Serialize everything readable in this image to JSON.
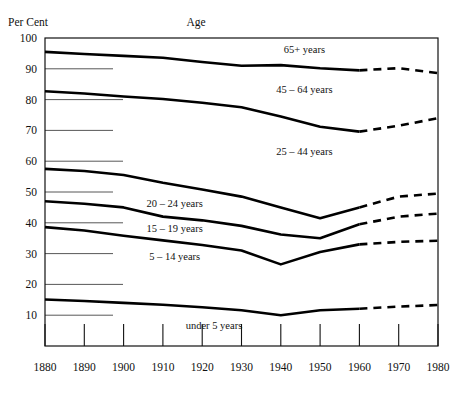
{
  "chart_data": {
    "type": "line",
    "title": "",
    "ylabel": "Per Cent",
    "xlabel": "",
    "legend_title": "Age",
    "grid": "horizontal-left-stubs",
    "legend_position": "inline-labels",
    "xlim": [
      1880,
      1980
    ],
    "ylim": [
      0,
      100
    ],
    "x": [
      1880,
      1890,
      1900,
      1910,
      1920,
      1930,
      1940,
      1950,
      1960,
      1970,
      1980
    ],
    "yticks": [
      10,
      20,
      30,
      40,
      50,
      60,
      70,
      80,
      90,
      100
    ],
    "ytick_labels": [
      "10",
      "20",
      "30",
      "40",
      "50",
      "60",
      "70",
      "80",
      "90",
      "100"
    ],
    "xtick_labels": [
      "1880",
      "1890",
      "1900",
      "1910",
      "1920",
      "1930",
      "1940",
      "1950",
      "1960",
      "1970",
      "1980"
    ],
    "projection_start_year": 1960,
    "series": [
      {
        "name": "65+ years",
        "label": "65+ years",
        "values": [
          95.5,
          94.8,
          94.2,
          93.6,
          92.2,
          91.0,
          91.2,
          90.2,
          89.5,
          90.2,
          88.6
        ],
        "solid_through": 1960
      },
      {
        "name": "45-64 years",
        "label": "45 – 64 years",
        "values": [
          82.7,
          82.0,
          81.0,
          80.2,
          79.0,
          77.5,
          74.5,
          71.2,
          69.6,
          71.5,
          74.0
        ],
        "solid_through": 1960
      },
      {
        "name": "25-44 years",
        "label": "25 – 44 years",
        "values": [
          57.5,
          56.8,
          55.5,
          53.0,
          50.8,
          48.5,
          45.0,
          41.5,
          45.0,
          48.5,
          49.5
        ],
        "solid_through": 1960
      },
      {
        "name": "20-24 years",
        "label": "20 – 24 years",
        "values": [
          47.0,
          46.2,
          45.0,
          42.0,
          40.8,
          39.0,
          36.2,
          35.0,
          39.5,
          42.0,
          43.0
        ],
        "solid_through": 1960
      },
      {
        "name": "15-19 years",
        "label": "15 – 19 years",
        "values": [
          38.6,
          37.5,
          35.8,
          34.3,
          32.8,
          31.0,
          26.5,
          30.5,
          33.0,
          33.8,
          34.2
        ],
        "solid_through": 1960
      },
      {
        "name": "5-14 years",
        "label": "5 – 14 years",
        "values": [
          38.6,
          37.5,
          35.8,
          34.3,
          32.8,
          31.0,
          26.5,
          30.5,
          33.0,
          33.8,
          34.2
        ],
        "solid_through": 1960,
        "is_label_only": true
      },
      {
        "name": "under 5 years",
        "label": "under 5 years",
        "values": [
          15.1,
          14.6,
          14.0,
          13.4,
          12.6,
          11.6,
          10.0,
          11.6,
          12.1,
          12.8,
          13.3
        ],
        "solid_through": 1960
      }
    ],
    "inline_labels": [
      {
        "text": "65+ years",
        "x": 1946,
        "y": 95.0
      },
      {
        "text": "45 – 64 years",
        "x": 1946,
        "y": 82.0
      },
      {
        "text": "25 – 44 years",
        "x": 1946,
        "y": 62.0
      },
      {
        "text": "20 – 24 years",
        "x": 1913,
        "y": 45.0
      },
      {
        "text": "15 – 19 years",
        "x": 1913,
        "y": 37.0
      },
      {
        "text": "5 – 14 years",
        "x": 1913,
        "y": 28.0
      },
      {
        "text": "under 5 years",
        "x": 1923,
        "y": 5.5
      }
    ]
  }
}
